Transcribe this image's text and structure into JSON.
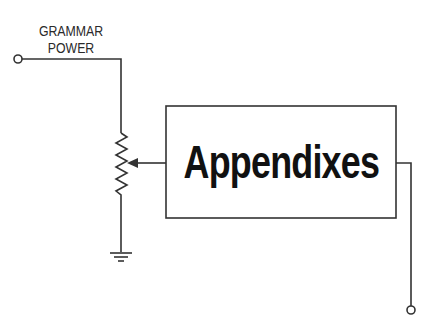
{
  "diagram": {
    "input_label_line1": "GRAMMAR",
    "input_label_line2": "POWER",
    "box_title": "Appendixes",
    "components": [
      "input-terminal",
      "potentiometer",
      "ground",
      "block-box",
      "output-terminal"
    ],
    "colors": {
      "line": "#333333",
      "text": "#111111",
      "background": "#ffffff"
    }
  }
}
